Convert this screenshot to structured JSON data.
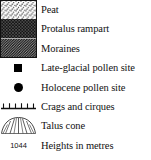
{
  "legend": {
    "title": "Map legend",
    "entries": [
      {
        "label": "Peat",
        "symbol": "stipple-swatch"
      },
      {
        "label": "Protalus rampart",
        "symbol": "crosshatch-swatch"
      },
      {
        "label": "Moraines",
        "symbol": "diagonal-hatch-swatch"
      },
      {
        "label": "Late-glacial pollen site",
        "symbol": "filled-square-marker"
      },
      {
        "label": "Holocene pollen site",
        "symbol": "filled-circle-marker"
      },
      {
        "label": "Crags and cirques",
        "symbol": "hachured-line-symbol"
      },
      {
        "label": "Talus cone",
        "symbol": "talus-cone-symbol"
      },
      {
        "label": "Heights in metres",
        "symbol": "spot-height-number"
      }
    ],
    "spot_height_value": "1044"
  },
  "colors": {
    "ink": "#111111",
    "background": "#ffffff"
  }
}
